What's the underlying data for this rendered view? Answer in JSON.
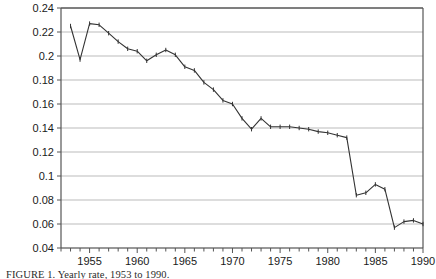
{
  "figure": {
    "caption_prefix": "FIGURE 1",
    "caption_text": "FIGURE 1.  Yearly rate, 1953 to 1990."
  },
  "chart_data": {
    "type": "line",
    "title": "",
    "xlabel": "",
    "ylabel": "",
    "xlim": [
      1952,
      1990
    ],
    "ylim": [
      0.04,
      0.24
    ],
    "grid": true,
    "legend": "none",
    "y_ticks": [
      0.04,
      0.06,
      0.08,
      0.1,
      0.12,
      0.14,
      0.16,
      0.18,
      0.2,
      0.22,
      0.24
    ],
    "y_tick_labels": [
      "0.04",
      "0.06",
      "0.08",
      "0.1",
      "0.12",
      "0.14",
      "0.16",
      "0.18",
      "0.2",
      "0.22",
      "0.24"
    ],
    "x_ticks": [
      1955,
      1960,
      1965,
      1970,
      1975,
      1980,
      1985,
      1990
    ],
    "x_tick_labels": [
      "1955",
      "1960",
      "1965",
      "1970",
      "1975",
      "1980",
      "1985",
      "1990"
    ],
    "x_minor_tick_step": 1,
    "line_color": "#333333",
    "marker": "tick",
    "x": [
      1953,
      1954,
      1955,
      1956,
      1957,
      1958,
      1959,
      1960,
      1961,
      1962,
      1963,
      1964,
      1965,
      1966,
      1967,
      1968,
      1969,
      1970,
      1971,
      1972,
      1973,
      1974,
      1975,
      1976,
      1977,
      1978,
      1979,
      1980,
      1981,
      1982,
      1983,
      1984,
      1985,
      1986,
      1987,
      1988,
      1989,
      1990
    ],
    "values": [
      0.225,
      0.197,
      0.227,
      0.226,
      0.219,
      0.212,
      0.206,
      0.204,
      0.196,
      0.201,
      0.205,
      0.201,
      0.191,
      0.188,
      0.178,
      0.172,
      0.163,
      0.16,
      0.148,
      0.139,
      0.148,
      0.141,
      0.141,
      0.141,
      0.14,
      0.139,
      0.137,
      0.136,
      0.134,
      0.132,
      0.084,
      0.086,
      0.093,
      0.089,
      0.057,
      0.062,
      0.063,
      0.06
    ]
  }
}
